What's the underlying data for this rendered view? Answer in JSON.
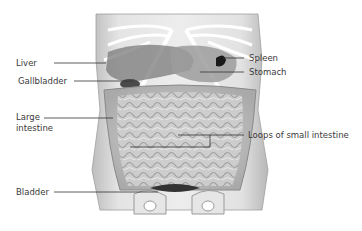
{
  "diagram": {
    "labels": {
      "liver": "Liver",
      "gallbladder": "Gallbladder",
      "large_intestine_1": "Large",
      "large_intestine_2": "intestine",
      "bladder": "Bladder",
      "spleen": "Spleen",
      "stomach": "Stomach",
      "small_intestine": "Loops of small intestine"
    },
    "colors": {
      "background": "#ffffff",
      "body": "#d9d9d9",
      "organ_dark": "#6e6e6e",
      "spleen": "#1a1a1a",
      "leader_line": "#333333",
      "text": "#3a3a3a"
    }
  }
}
